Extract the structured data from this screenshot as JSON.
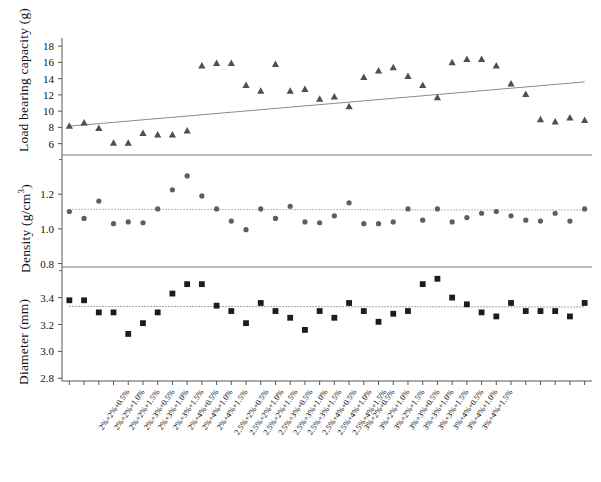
{
  "chart_data": {
    "type": "scatter",
    "title": "",
    "xlabel": "",
    "legend": [],
    "grid": false,
    "panels": [
      {
        "name": "load-bearing-capacity",
        "ylabel": "Load bearing capacity (g)",
        "ylim": [
          4.6,
          19.0
        ],
        "yticks": [
          6,
          8,
          10,
          12,
          14,
          16,
          18
        ],
        "ytick_labels": [
          "6",
          "8",
          "10",
          "12",
          "14",
          "16",
          "18"
        ],
        "marker": "triangle",
        "marker_color": "#4f4f4f",
        "trendline": {
          "x0": 0,
          "y0": 8.15,
          "x1": 35,
          "y1": 13.6,
          "color": "#8a8a8a",
          "style": "solid"
        },
        "values": [
          8.2,
          8.6,
          7.9,
          6.1,
          6.1,
          7.3,
          7.1,
          7.1,
          7.6,
          15.6,
          15.9,
          15.9,
          13.2,
          12.5,
          15.8,
          12.5,
          12.7,
          11.5,
          11.8,
          10.6,
          14.2,
          15.0,
          15.4,
          14.3,
          13.2,
          11.7,
          16.0,
          16.4,
          16.4,
          15.6,
          13.4,
          12.1,
          9.0,
          8.7,
          9.2,
          8.9
        ]
      },
      {
        "name": "density",
        "ylabel": "Density (g/cm3)",
        "ylim": [
          0.78,
          1.42
        ],
        "yticks": [
          0.8,
          1.0,
          1.2
        ],
        "ytick_labels": [
          "0.8",
          "1.0",
          "1.2"
        ],
        "marker": "circle",
        "marker_color": "#5e5e5e",
        "trendline": {
          "x0": 0,
          "y0": 1.113,
          "x1": 35,
          "y1": 1.108,
          "color": "#9a9a9a",
          "style": "dotted"
        },
        "values": [
          1.1,
          1.06,
          1.16,
          1.03,
          1.04,
          1.035,
          1.115,
          1.225,
          1.305,
          1.19,
          1.115,
          1.045,
          0.995,
          1.115,
          1.06,
          1.13,
          1.04,
          1.035,
          1.075,
          1.15,
          1.03,
          1.03,
          1.04,
          1.115,
          1.05,
          1.115,
          1.04,
          1.065,
          1.09,
          1.1,
          1.075,
          1.05,
          1.045,
          1.09,
          1.045,
          1.115
        ]
      },
      {
        "name": "diameter",
        "ylabel": "Diameter (mm)",
        "ylim": [
          2.78,
          3.62
        ],
        "yticks": [
          2.8,
          3.0,
          3.2,
          3.4
        ],
        "ytick_labels": [
          "2.8",
          "3.0",
          "3.2",
          "3.4"
        ],
        "marker": "square",
        "marker_color": "#1c1c1c",
        "trendline": {
          "x0": 0,
          "y0": 3.335,
          "x1": 35,
          "y1": 3.33,
          "color": "#7d7d7d",
          "style": "dotted"
        },
        "values": [
          3.38,
          3.38,
          3.29,
          3.29,
          3.13,
          3.21,
          3.29,
          3.43,
          3.5,
          3.5,
          3.34,
          3.3,
          3.21,
          3.36,
          3.3,
          3.25,
          3.16,
          3.3,
          3.25,
          3.36,
          3.3,
          3.22,
          3.28,
          3.3,
          3.5,
          3.54,
          3.4,
          3.35,
          3.29,
          3.26,
          3.36,
          3.3,
          3.3,
          3.3,
          3.26,
          3.36
        ]
      }
    ],
    "categories": [
      "2%+2%+0.5%",
      "2%+2%+1.0%",
      "2%+2%+1.5%",
      "2%+3%+0.5%",
      "2%+3%+1.0%",
      "2%+3%+1.5%",
      "2%+4%+0.5%",
      "2%+4%+1.0%",
      "2%+4%+1.5%",
      "2.5%+2%+0.5%",
      "2.5%+2%+1.0%",
      "2.5%+2%+1.5%",
      "2.5%+3%+0.5%",
      "2.5%+3%+1.0%",
      "2.5%+3%+1.5%",
      "2.5%+4%+0.5%",
      "2.5%+4%+1.0%",
      "2.5%+4%+1.5%",
      "3%+2%+0.5%",
      "3%+2%+1.0%",
      "3%+2%+1.5%",
      "3%+3%+0.5%",
      "3%+3%+1.0%",
      "3%+3%+1.5%",
      "3%+4%+0.5%",
      "3%+4%+1.0%",
      "3%+4%+1.5%"
    ],
    "categories_full": [
      "2%+2%+0.5%",
      "2%+2%+1.0%",
      "2%+2%+1.5%",
      "2%+3%+0.5%",
      "2%+3%+1.0%",
      "2%+3%+1.5%",
      "2%+4%+0.5%",
      "2%+4%+1.0%",
      "2%+4%+1.5%",
      "2.5%+2%+0.5%",
      "2.5%+2%+1.0%",
      "2.5%+2%+1.5%",
      "2.5%+3%+0.5%",
      "2.5%+3%+1.0%",
      "2.5%+3%+1.5%",
      "2.5%+4%+0.5%",
      "2.5%+4%+1.0%",
      "2.5%+4%+1.5%",
      "3%+2%+0.5%",
      "3%+2%+1.0%",
      "3%+2%+1.5%",
      "3%+3%+0.5%",
      "3%+3%+1.0%",
      "3%+3%+1.5%",
      "3%+4%+0.5%",
      "3%+4%+1.0%",
      "3%+4%+1.5%"
    ]
  },
  "axis_titles": {
    "load": "Load bearing capacity (g)",
    "density_pre": "Density (g/cm",
    "density_sup": "3",
    "density_post": ")",
    "diameter": "Diameter (mm)"
  }
}
